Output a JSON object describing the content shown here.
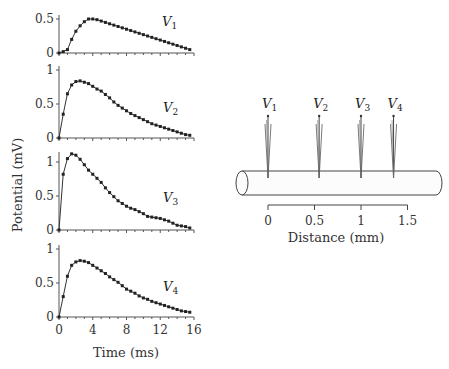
{
  "chart_data": {
    "type": "line",
    "title": "",
    "panels": [
      {
        "name": "V1",
        "label_main": "V",
        "label_sub": "1",
        "yticks": [
          0,
          0.5
        ],
        "ytick_labels": [
          "0",
          "0.5"
        ],
        "ylim": [
          0,
          0.55
        ],
        "x": [
          0,
          0.5,
          1,
          1.5,
          2,
          2.5,
          3,
          3.5,
          4,
          4.5,
          5,
          5.5,
          6,
          6.5,
          7,
          7.5,
          8,
          8.5,
          9,
          9.5,
          10,
          10.5,
          11,
          11.5,
          12,
          12.5,
          13,
          13.5,
          14,
          14.5,
          15,
          15.5
        ],
        "values": [
          0,
          0.02,
          0.05,
          0.2,
          0.32,
          0.4,
          0.46,
          0.5,
          0.5,
          0.49,
          0.47,
          0.45,
          0.43,
          0.41,
          0.39,
          0.37,
          0.35,
          0.33,
          0.31,
          0.29,
          0.27,
          0.25,
          0.23,
          0.21,
          0.19,
          0.17,
          0.15,
          0.13,
          0.11,
          0.09,
          0.07,
          0.05
        ]
      },
      {
        "name": "V2",
        "label_main": "V",
        "label_sub": "2",
        "yticks": [
          0,
          0.5,
          1
        ],
        "ytick_labels": [
          "0",
          "0.5",
          "1"
        ],
        "ylim": [
          0,
          1
        ],
        "x": [
          0,
          0.5,
          1,
          1.5,
          2,
          2.5,
          3,
          3.5,
          4,
          4.5,
          5,
          5.5,
          6,
          6.5,
          7,
          7.5,
          8,
          8.5,
          9,
          9.5,
          10,
          10.5,
          11,
          11.5,
          12,
          12.5,
          13,
          13.5,
          14,
          14.5,
          15,
          15.5
        ],
        "values": [
          0,
          0.35,
          0.65,
          0.78,
          0.83,
          0.84,
          0.82,
          0.8,
          0.76,
          0.72,
          0.69,
          0.64,
          0.59,
          0.53,
          0.48,
          0.44,
          0.4,
          0.36,
          0.33,
          0.3,
          0.27,
          0.24,
          0.21,
          0.19,
          0.17,
          0.15,
          0.13,
          0.11,
          0.09,
          0.07,
          0.05,
          0.04
        ]
      },
      {
        "name": "V3",
        "label_main": "V",
        "label_sub": "3",
        "yticks": [
          0,
          0.5,
          1
        ],
        "ytick_labels": [
          "0",
          "0.5",
          "1"
        ],
        "ylim": [
          0,
          1.15
        ],
        "x": [
          0,
          0.5,
          1,
          1.5,
          2,
          2.5,
          3,
          3.5,
          4,
          4.5,
          5,
          5.5,
          6,
          6.5,
          7,
          7.5,
          8,
          8.5,
          9,
          9.5,
          10,
          10.5,
          11,
          11.5,
          12,
          12.5,
          13,
          13.5,
          14,
          14.5,
          15,
          15.5
        ],
        "values": [
          0,
          0.82,
          1.05,
          1.12,
          1.1,
          1.04,
          0.96,
          0.88,
          0.82,
          0.76,
          0.7,
          0.62,
          0.55,
          0.49,
          0.43,
          0.39,
          0.35,
          0.32,
          0.3,
          0.27,
          0.24,
          0.2,
          0.19,
          0.18,
          0.17,
          0.15,
          0.13,
          0.1,
          0.07,
          0.06,
          0.05,
          0.03
        ]
      },
      {
        "name": "V4",
        "label_main": "V",
        "label_sub": "4",
        "yticks": [
          0,
          0.5,
          1
        ],
        "ytick_labels": [
          "0",
          "0.5",
          "1"
        ],
        "ylim": [
          0,
          1
        ],
        "x": [
          0,
          0.5,
          1,
          1.5,
          2,
          2.5,
          3,
          3.5,
          4,
          4.5,
          5,
          5.5,
          6,
          6.5,
          7,
          7.5,
          8,
          8.5,
          9,
          9.5,
          10,
          10.5,
          11,
          11.5,
          12,
          12.5,
          13,
          13.5,
          14,
          14.5,
          15,
          15.5
        ],
        "values": [
          0,
          0.3,
          0.6,
          0.76,
          0.81,
          0.83,
          0.82,
          0.8,
          0.76,
          0.72,
          0.68,
          0.64,
          0.59,
          0.55,
          0.51,
          0.46,
          0.41,
          0.38,
          0.35,
          0.31,
          0.28,
          0.26,
          0.23,
          0.21,
          0.19,
          0.17,
          0.15,
          0.13,
          0.11,
          0.09,
          0.08,
          0.07
        ]
      }
    ],
    "xlabel": "Time (ms)",
    "ylabel": "Potential (mV)",
    "xticks": [
      0,
      4,
      8,
      12,
      16
    ],
    "xtick_labels": [
      "0",
      "4",
      "8",
      "12",
      "16"
    ],
    "xlim": [
      0,
      16
    ],
    "grid": false,
    "diagram": {
      "xlabel": "Distance (mm)",
      "xticks": [
        0,
        0.5,
        1,
        1.5
      ],
      "xtick_labels": [
        "0",
        "0.5",
        "1",
        "1.5"
      ],
      "electrodes": [
        {
          "main": "V",
          "sub": "1",
          "position_mm": 0
        },
        {
          "main": "V",
          "sub": "2",
          "position_mm": 0.55
        },
        {
          "main": "V",
          "sub": "3",
          "position_mm": 1.0
        },
        {
          "main": "V",
          "sub": "4",
          "position_mm": 1.35
        }
      ]
    }
  }
}
